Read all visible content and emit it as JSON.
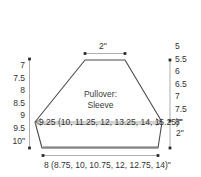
{
  "diagram": {
    "title_lines": [
      "Pullover:",
      "Sleeve"
    ],
    "title_line_1": "Pullover:",
    "title_line_2": "Sleeve",
    "shape_name": "sleeve-schematic",
    "colors": {
      "background": "#ffffff",
      "outline": "#4a4a4a",
      "dimension_line": "#8c8c8c",
      "text": "#333333"
    },
    "dimensions": {
      "top_width": "2\"",
      "upper_arm_width": "9.25 (10, 11.25, 12, 13.25, 14, 15.25)\"",
      "cuff_width": "8 (8.75, 10, 10.75, 12, 12.75, 14)\"",
      "right_cap_depth": "2\""
    },
    "left_scale": {
      "name": "sleeve-length-options",
      "values": [
        "7",
        "7.5",
        "8",
        "8.5",
        "9",
        "9.5",
        "10\""
      ]
    },
    "right_scale": {
      "name": "sleeve-underarm-options",
      "values": [
        "5",
        "5.5",
        "6",
        "6.5",
        "7",
        "7.5",
        "8\""
      ]
    }
  }
}
